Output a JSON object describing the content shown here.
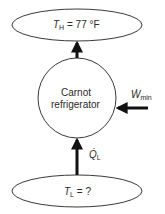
{
  "diagram": {
    "hot_reservoir": {
      "symbol": "T",
      "subscript": "H",
      "value": " = 77 °F"
    },
    "device": {
      "line1": "Carnot",
      "line2": "refrigerator"
    },
    "work_input": {
      "symbol": "Ẇ",
      "subscript": "min"
    },
    "heat_input": {
      "symbol": "Q̇",
      "subscript": "L"
    },
    "cold_reservoir": {
      "symbol": "T",
      "subscript": "L",
      "value": " = ?"
    },
    "colors": {
      "stroke": "#3a3a3a",
      "arrow": "#111111",
      "text": "#2a2a2a"
    }
  }
}
